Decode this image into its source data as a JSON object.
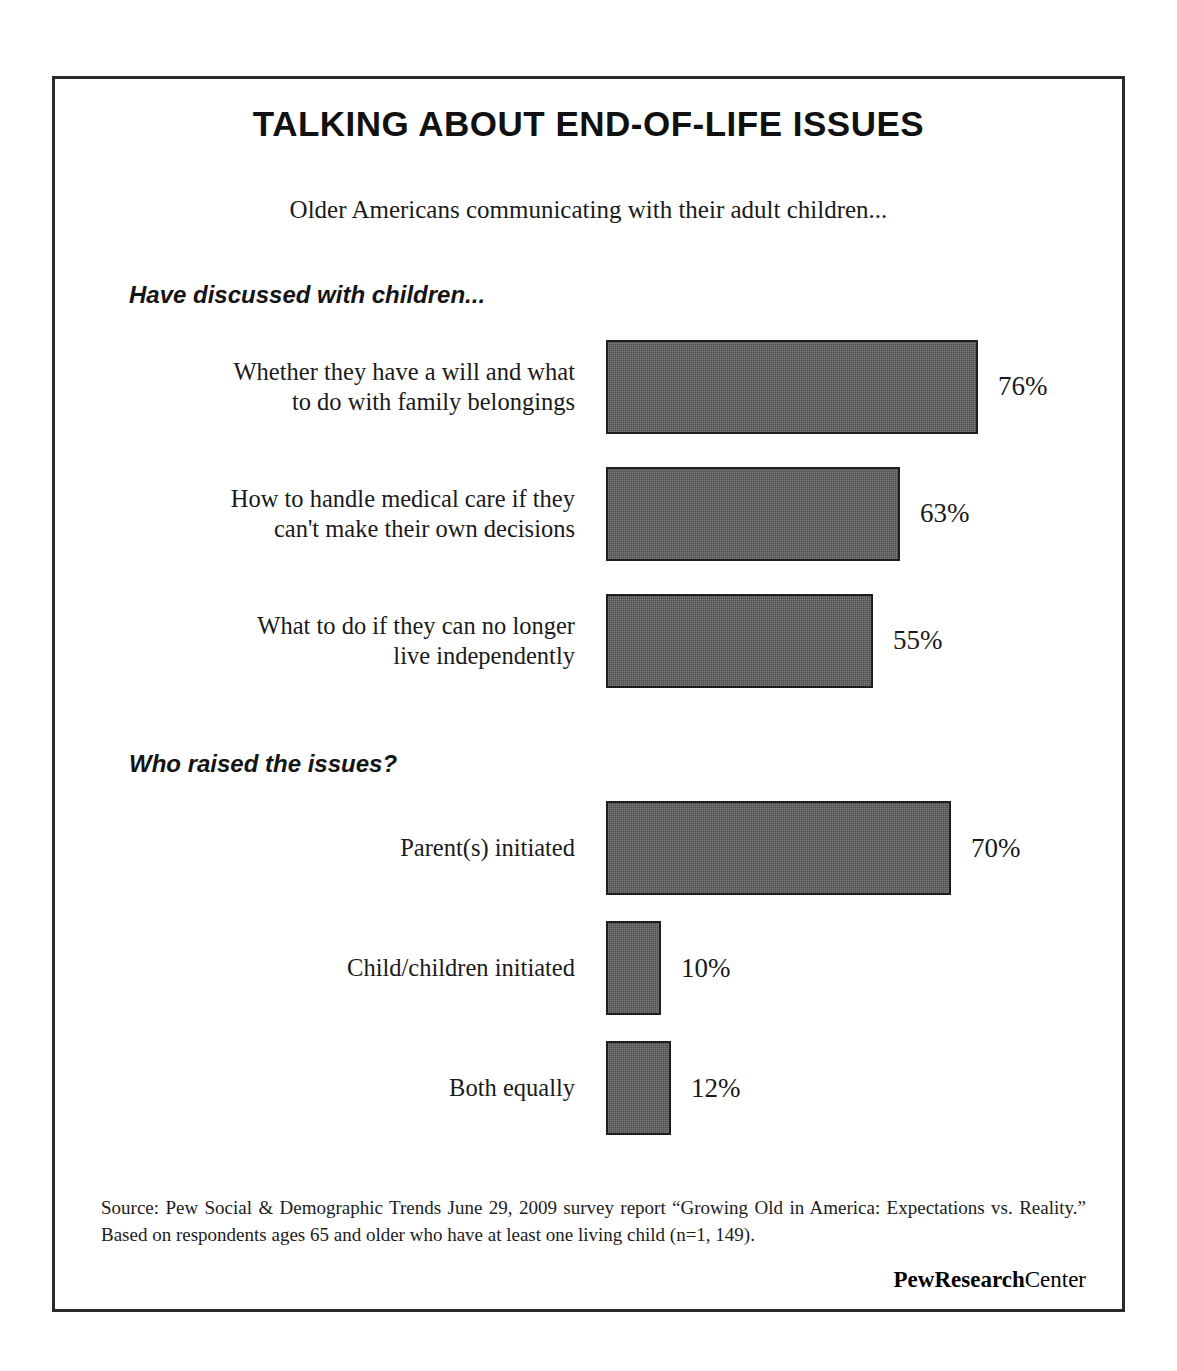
{
  "title": "TALKING ABOUT END-OF-LIFE ISSUES",
  "subtitle": "Older Americans communicating with their adult children...",
  "sections": [
    {
      "heading": "Have discussed with children...",
      "rows": [
        {
          "label": "Whether they have a will and what\nto do with family belongings",
          "value_label": "76%",
          "value": 76
        },
        {
          "label": "How to handle medical care if they\ncan't make their own decisions",
          "value_label": "63%",
          "value": 63
        },
        {
          "label": "What to do if they can no longer\nlive independently",
          "value_label": "55%",
          "value": 55
        }
      ]
    },
    {
      "heading": "Who raised the issues?",
      "rows": [
        {
          "label": "Parent(s) initiated",
          "value_label": "70%",
          "value": 70
        },
        {
          "label": "Child/children initiated",
          "value_label": "10%",
          "value": 10
        },
        {
          "label": "Both equally",
          "value_label": "12%",
          "value": 12
        }
      ]
    }
  ],
  "source": "Source: Pew Social & Demographic Trends June 29, 2009 survey report “Growing Old in America: Expectations vs. Reality.” Based on respondents ages 65 and older who have at least one living child (n=1, 149).",
  "logo": {
    "bold_part": "PewResearch",
    "light_part": "Center"
  },
  "colors": {
    "bar_fill": "#4d4d4d",
    "bar_border": "#1e1e1e",
    "frame": "#2b2b2b",
    "text": "#1a1a1a"
  },
  "chart_data": {
    "type": "bar",
    "orientation": "horizontal",
    "title": "TALKING ABOUT END-OF-LIFE ISSUES",
    "subtitle": "Older Americans communicating with their adult children...",
    "xlabel": "",
    "ylabel": "",
    "unit": "percent",
    "grid": false,
    "legend": "none",
    "groups": [
      {
        "name": "Have discussed with children...",
        "categories": [
          "Whether they have a will and what to do with family belongings",
          "How to handle medical care if they can't make their own decisions",
          "What to do if they can no longer live independently"
        ],
        "values": [
          76,
          63,
          55
        ],
        "data_labels": [
          "76%",
          "63%",
          "55%"
        ],
        "bar_pixel_widths": [
          372,
          294,
          267
        ]
      },
      {
        "name": "Who raised the issues?",
        "categories": [
          "Parent(s) initiated",
          "Child/children initiated",
          "Both equally"
        ],
        "values": [
          70,
          10,
          12
        ],
        "data_labels": [
          "70%",
          "10%",
          "12%"
        ],
        "bar_pixel_widths": [
          345,
          55,
          65
        ]
      }
    ],
    "source": "Pew Social & Demographic Trends June 29, 2009 survey report “Growing Old in America: Expectations vs. Reality.” Based on respondents ages 65 and older who have at least one living child (n=1, 149)."
  }
}
